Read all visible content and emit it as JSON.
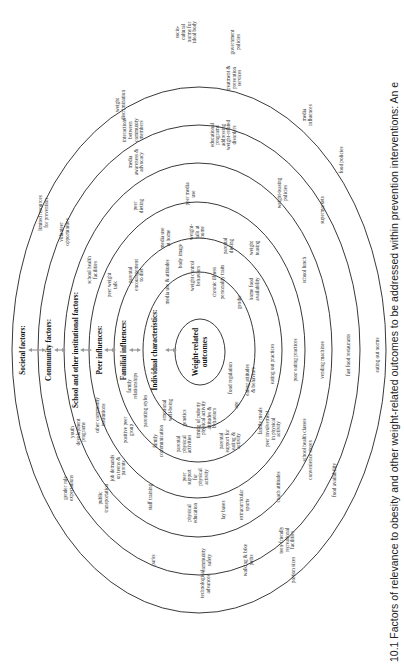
{
  "figure": {
    "caption": "10.1  Factors of relevance to obesity and other weight-related outcomes to be addressed within prevention interventions: An e",
    "orientation": "rotated -90deg (text reads bottom-to-top)",
    "center": "Weight-related outcomes",
    "levels": [
      "Societal factors:",
      "Community factors:",
      "School and other institutional factors:",
      "Peer influences:",
      "Familial influences:",
      "Individual characteristics:"
    ],
    "core": [
      "Weight-related",
      "outcomes"
    ],
    "societal": [
      [
        "socio-",
        "cultural",
        "norms for",
        "ideal body"
      ],
      [
        "government",
        "policies"
      ],
      [
        "media",
        "influences"
      ],
      [
        "food policies"
      ],
      [
        "eating out norms"
      ],
      [
        "fast food restaurants"
      ],
      [
        "food availability"
      ],
      [
        "portion sizes"
      ],
      [
        "technological",
        "advances"
      ],
      [
        "gender role",
        "expectations"
      ],
      [
        "limited resources",
        "for prevention"
      ],
      [
        "weight",
        "discrimination"
      ]
    ],
    "community": [
      [
        "interactions",
        "between",
        "community",
        "members"
      ],
      [
        "treatment &",
        "prevention",
        "services"
      ],
      [
        "supermarkets"
      ],
      [
        "vending machines"
      ],
      [
        "convenience stores"
      ],
      [
        "walking & bike",
        "paths"
      ],
      [
        "community",
        "safety"
      ],
      [
        "parks"
      ],
      [
        "public",
        "transportation"
      ],
      [
        "youth",
        "development",
        "programs"
      ],
      [
        "volunteer",
        "opportunities"
      ],
      [
        "teen-friendly",
        "recreational",
        "facilities"
      ]
    ],
    "school": [
      [
        "media",
        "awareness &",
        "advocacy"
      ],
      [
        "educational",
        "programs",
        "addressing",
        "weight-related",
        "disorders"
      ],
      [
        "weight-teasing",
        "policies"
      ],
      [
        "school lunch"
      ],
      [
        "school health classes"
      ],
      [
        "extracurricular",
        "sports"
      ],
      [
        "physical",
        "education"
      ],
      [
        "staff training"
      ],
      [
        "job demands",
        "on teens &",
        "parents"
      ],
      [
        "other community",
        "institutions"
      ],
      [
        "school health",
        "facilities"
      ],
      [
        "coach attitudes"
      ]
    ],
    "peer": [
      [
        "peer",
        "dieting"
      ],
      [
        "peer media",
        "use"
      ],
      [
        "weight",
        "teasing"
      ],
      [
        "poor eating practices"
      ],
      [
        "peer involvement",
        "in physical",
        "activity"
      ],
      [
        "peer",
        "support",
        "for",
        "physical",
        "activity"
      ],
      [
        "positive peer",
        "group"
      ],
      [
        "peer weight",
        "talk"
      ],
      [
        "lay bases"
      ]
    ],
    "familial": [
      [
        "parental",
        "encouragement",
        "to diet"
      ],
      [
        "media use",
        "at home"
      ],
      [
        "weight-",
        "talk at",
        "home"
      ],
      [
        "parental",
        "dieting"
      ],
      [
        "home food",
        "availability"
      ],
      [
        "eating out practices"
      ],
      [
        "family meals"
      ],
      [
        "parental",
        "support for",
        "eating &",
        "activity"
      ],
      [
        "parental",
        "physical",
        "activities"
      ],
      [
        "family",
        "communication"
      ],
      [
        "parenting styles"
      ],
      [
        "family",
        "relationships"
      ]
    ],
    "individual": [
      [
        "media use & attitudes"
      ],
      [
        "body image"
      ],
      [
        "weight control",
        "behaviors"
      ],
      [
        "chronic illness"
      ],
      [
        "personality traits"
      ],
      [
        "gender"
      ],
      [
        "food regulation"
      ],
      [
        "eating attitudes",
        "& behaviors"
      ],
      [
        "age"
      ],
      [
        "physical activity",
        "attitudes &",
        "behaviors"
      ],
      [
        "timing of puberty"
      ],
      [
        "genetics"
      ],
      [
        "emotional",
        "well-being"
      ]
    ]
  }
}
